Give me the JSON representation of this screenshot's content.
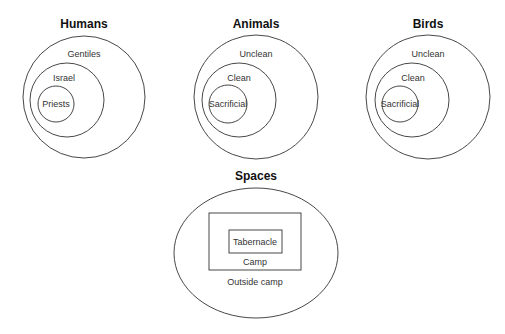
{
  "diagrams": {
    "humans": {
      "title": "Humans",
      "rings": [
        "Gentiles",
        "Israel",
        "Priests"
      ]
    },
    "animals": {
      "title": "Animals",
      "rings": [
        "Unclean",
        "Clean",
        "Sacrificial"
      ]
    },
    "birds": {
      "title": "Birds",
      "rings": [
        "Unclean",
        "Clean",
        "Sacrificial"
      ]
    },
    "spaces": {
      "title": "Spaces",
      "regions": [
        "Outside camp",
        "Camp",
        "Tabernacle"
      ]
    }
  },
  "colors": {
    "stroke": "#333333",
    "text": "#333333",
    "background": "#ffffff"
  }
}
